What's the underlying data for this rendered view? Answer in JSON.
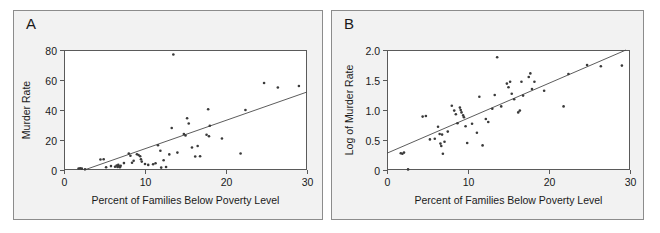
{
  "figure": {
    "background": "#ffffff",
    "panel_background": "#f2f2f2",
    "plot_background": "#ffffff",
    "frame_color": "#5a5a5a",
    "point_color": "#3a3a3a",
    "line_color": "#4a4a4a",
    "text_color": "#1a1a1a"
  },
  "panels": {
    "a": {
      "letter": "A",
      "xlabel": "Percent of Families Below Poverty Level",
      "ylabel": "Murder Rate",
      "xticks": [
        "0",
        "10",
        "20",
        "30"
      ],
      "yticks": [
        "0",
        "20",
        "40",
        "60",
        "80"
      ]
    },
    "b": {
      "letter": "B",
      "xlabel": "Percent of Families Below Poverty Level",
      "ylabel": "Log of Murder Rate",
      "xticks": [
        "0",
        "10",
        "20",
        "30"
      ],
      "yticks": [
        "0",
        "0.5",
        "1.0",
        "1.5",
        "2.0"
      ]
    }
  },
  "chart_data": [
    {
      "id": "panel-a",
      "type": "scatter",
      "title": "A",
      "xlabel": "Percent of Families Below Poverty Level",
      "ylabel": "Murder Rate",
      "xlim": [
        0,
        30
      ],
      "ylim": [
        0,
        80
      ],
      "xticks": [
        0,
        10,
        20,
        30
      ],
      "yticks": [
        0,
        20,
        40,
        60,
        80
      ],
      "grid": false,
      "legend": "none",
      "points": [
        [
          1.8,
          1.0
        ],
        [
          2.0,
          1.2
        ],
        [
          2.2,
          0.9
        ],
        [
          2.6,
          0.5
        ],
        [
          4.5,
          7.0
        ],
        [
          4.9,
          7.2
        ],
        [
          5.2,
          1.8
        ],
        [
          5.8,
          2.6
        ],
        [
          6.3,
          2.2
        ],
        [
          6.5,
          3.0
        ],
        [
          6.6,
          2.0
        ],
        [
          6.7,
          3.4
        ],
        [
          6.8,
          2.4
        ],
        [
          6.9,
          1.8
        ],
        [
          7.0,
          2.8
        ],
        [
          7.4,
          4.6
        ],
        [
          8.0,
          11.0
        ],
        [
          8.2,
          9.5
        ],
        [
          8.4,
          4.8
        ],
        [
          8.6,
          6.2
        ],
        [
          9.0,
          10.5
        ],
        [
          9.2,
          10.0
        ],
        [
          9.4,
          9.2
        ],
        [
          9.5,
          7.2
        ],
        [
          9.6,
          5.6
        ],
        [
          10.0,
          4.0
        ],
        [
          10.4,
          3.4
        ],
        [
          11.0,
          3.8
        ],
        [
          11.3,
          4.5
        ],
        [
          11.6,
          16.5
        ],
        [
          11.9,
          12.8
        ],
        [
          12.0,
          1.6
        ],
        [
          12.3,
          6.5
        ],
        [
          12.6,
          2.0
        ],
        [
          13.0,
          10.4
        ],
        [
          13.3,
          28.0
        ],
        [
          13.5,
          77.0
        ],
        [
          14.0,
          11.6
        ],
        [
          14.8,
          24.0
        ],
        [
          15.0,
          23.0
        ],
        [
          15.2,
          34.5
        ],
        [
          15.4,
          31.0
        ],
        [
          15.8,
          15.0
        ],
        [
          16.2,
          9.0
        ],
        [
          16.5,
          16.0
        ],
        [
          16.8,
          9.2
        ],
        [
          17.6,
          23.5
        ],
        [
          17.8,
          40.5
        ],
        [
          17.9,
          22.5
        ],
        [
          18.0,
          29.5
        ],
        [
          19.5,
          21.0
        ],
        [
          21.8,
          11.0
        ],
        [
          22.4,
          40.0
        ],
        [
          24.7,
          58.0
        ],
        [
          26.4,
          55.0
        ],
        [
          29.0,
          56.0
        ]
      ],
      "fit_line": {
        "x": [
          2.5,
          30.0
        ],
        "y": [
          0.0,
          52.0
        ]
      }
    },
    {
      "id": "panel-b",
      "type": "scatter",
      "title": "B",
      "xlabel": "Percent of Families Below Poverty Level",
      "ylabel": "Log of Murder Rate",
      "xlim": [
        0,
        30
      ],
      "ylim": [
        0,
        2.0
      ],
      "xticks": [
        0,
        10,
        20,
        30
      ],
      "yticks": [
        0,
        0.5,
        1.0,
        1.5,
        2.0
      ],
      "grid": false,
      "legend": "none",
      "points": [
        [
          1.7,
          0.28
        ],
        [
          1.9,
          0.27
        ],
        [
          2.1,
          0.29
        ],
        [
          2.6,
          0.01
        ],
        [
          4.4,
          0.89
        ],
        [
          4.8,
          0.9
        ],
        [
          5.3,
          0.51
        ],
        [
          5.9,
          0.52
        ],
        [
          6.3,
          0.72
        ],
        [
          6.5,
          0.6
        ],
        [
          6.6,
          0.44
        ],
        [
          6.7,
          0.4
        ],
        [
          6.8,
          0.59
        ],
        [
          6.9,
          0.27
        ],
        [
          7.1,
          0.47
        ],
        [
          7.5,
          0.64
        ],
        [
          8.0,
          1.07
        ],
        [
          8.3,
          0.99
        ],
        [
          8.5,
          0.93
        ],
        [
          8.7,
          0.78
        ],
        [
          9.0,
          1.04
        ],
        [
          9.1,
          1.0
        ],
        [
          9.2,
          0.96
        ],
        [
          9.4,
          0.91
        ],
        [
          9.5,
          0.88
        ],
        [
          9.7,
          0.73
        ],
        [
          9.9,
          0.45
        ],
        [
          10.5,
          0.77
        ],
        [
          11.1,
          0.62
        ],
        [
          11.4,
          1.22
        ],
        [
          11.8,
          0.41
        ],
        [
          12.2,
          0.85
        ],
        [
          12.5,
          0.8
        ],
        [
          13.0,
          1.02
        ],
        [
          13.3,
          1.25
        ],
        [
          13.6,
          1.88
        ],
        [
          14.1,
          1.06
        ],
        [
          14.8,
          1.44
        ],
        [
          15.0,
          1.38
        ],
        [
          15.2,
          1.47
        ],
        [
          15.4,
          1.27
        ],
        [
          15.7,
          1.18
        ],
        [
          16.2,
          0.96
        ],
        [
          16.4,
          0.99
        ],
        [
          16.6,
          1.47
        ],
        [
          16.8,
          1.24
        ],
        [
          17.5,
          1.55
        ],
        [
          17.7,
          1.61
        ],
        [
          17.9,
          1.35
        ],
        [
          18.2,
          1.47
        ],
        [
          19.4,
          1.32
        ],
        [
          21.8,
          1.06
        ],
        [
          22.4,
          1.6
        ],
        [
          24.7,
          1.75
        ],
        [
          26.4,
          1.73
        ],
        [
          29.0,
          1.74
        ]
      ],
      "fit_line": {
        "x": [
          0.0,
          29.5
        ],
        "y": [
          0.28,
          2.0
        ]
      }
    }
  ]
}
